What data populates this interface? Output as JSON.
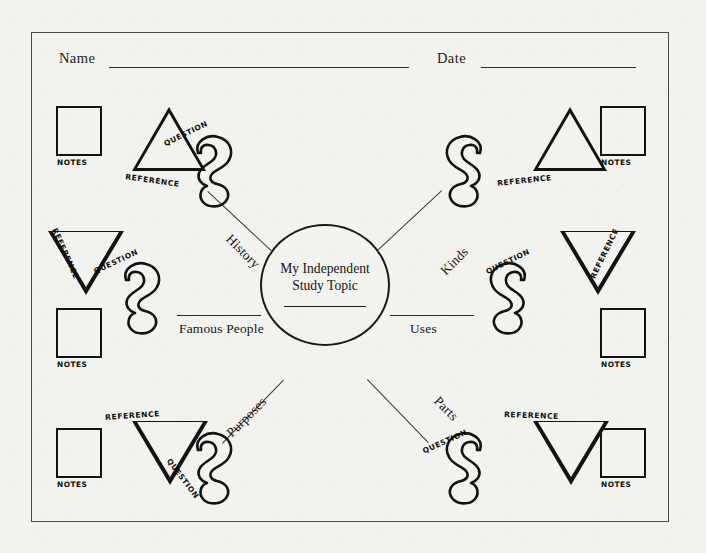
{
  "worksheet": {
    "title": "My Independent Study Topic",
    "header": {
      "name_label": "Name",
      "date_label": "Date"
    },
    "center": {
      "topic_text": "My Independent\nStudy Topic"
    },
    "shape_captions": {
      "notes": "NOTES",
      "reference": "REFERENCE",
      "question": "QUESTION"
    },
    "branches": [
      {
        "id": "history",
        "label": "History",
        "position": "upper-left"
      },
      {
        "id": "kinds",
        "label": "Kinds",
        "position": "upper-right"
      },
      {
        "id": "famous-people",
        "label": "Famous People",
        "position": "middle-left"
      },
      {
        "id": "uses",
        "label": "Uses",
        "position": "middle-right"
      },
      {
        "id": "purposes",
        "label": "Purposes",
        "position": "lower-left"
      },
      {
        "id": "parts",
        "label": "Parts",
        "position": "lower-right"
      }
    ],
    "colors": {
      "paper": "#f2f2ef",
      "ink": "#141414",
      "rule": "#2a2a28"
    }
  }
}
